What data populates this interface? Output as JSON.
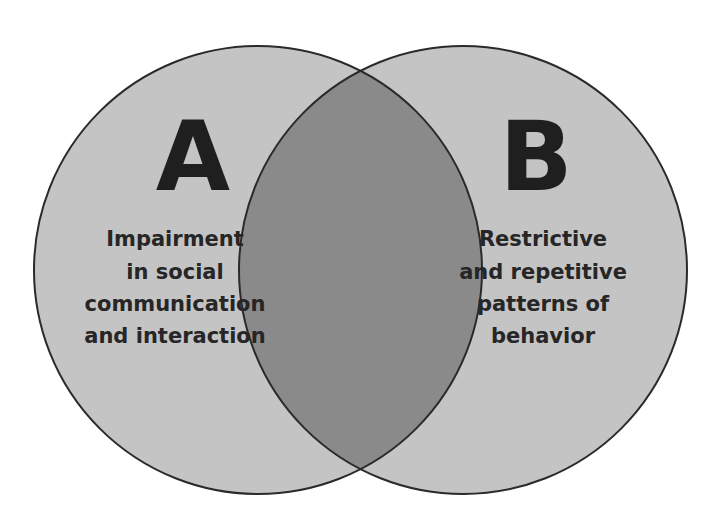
{
  "diagram": {
    "type": "venn",
    "colors": {
      "circle_fill": "#c4c4c4",
      "overlap_fill": "#8a8a8a",
      "stroke": "#2a2a2a",
      "text": "#222222",
      "background": "#ffffff"
    },
    "sets": [
      {
        "letter": "A",
        "lines": [
          "Impairment",
          "in social",
          "communication",
          "and interaction"
        ]
      },
      {
        "letter": "B",
        "lines": [
          "Restrictive",
          "and repetitive",
          "patterns of",
          "behavior"
        ]
      }
    ]
  }
}
